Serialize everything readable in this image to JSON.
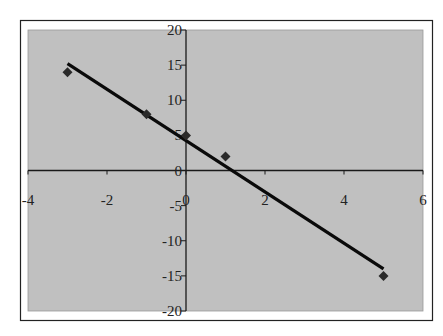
{
  "chart_data": {
    "type": "scatter",
    "title": "",
    "xlabel": "",
    "ylabel": "",
    "xlim": [
      -4,
      6
    ],
    "ylim": [
      -20,
      20
    ],
    "x_ticks": [
      -4,
      -2,
      0,
      2,
      4,
      6
    ],
    "y_ticks": [
      -20,
      -15,
      -10,
      -5,
      0,
      5,
      10,
      15,
      20
    ],
    "x_tick_labels": [
      "-4",
      "-2",
      "0",
      "2",
      "4",
      "6"
    ],
    "y_tick_labels": [
      "-20",
      "-15",
      "-10",
      "-5",
      "0",
      "5",
      "10",
      "15",
      "20"
    ],
    "grid": false,
    "legend": null,
    "series": [
      {
        "name": "data",
        "marker": "diamond",
        "x": [
          -3,
          -1,
          0,
          1,
          5
        ],
        "y": [
          14,
          8,
          5,
          2,
          -15
        ]
      }
    ],
    "trendline": {
      "type": "linear",
      "slope": -3.653,
      "intercept": 4.26,
      "x_start": -3,
      "x_end": 5
    }
  },
  "colors": {
    "plot_background": "#c0c0c0",
    "frame": "#222222",
    "axis": "#1a1a1a",
    "marker": "#2a2a2a",
    "trendline": "#0a0a0a"
  }
}
